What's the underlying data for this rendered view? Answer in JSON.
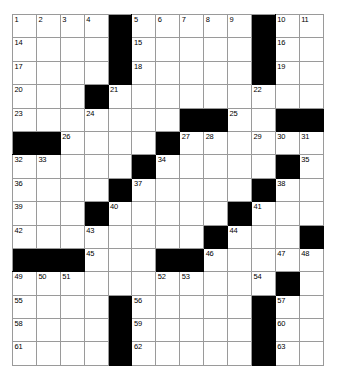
{
  "puzzle": {
    "type": "crossword-grid",
    "rows": 14,
    "cols": 13,
    "colors": {
      "block": "#000000",
      "cell": "#ffffff",
      "gridline": "#9a9a9a",
      "number": "#000000",
      "page_background": "#ffffff"
    },
    "cells": [
      [
        {
          "n": "1"
        },
        {
          "n": "2"
        },
        {
          "n": "3"
        },
        {
          "n": "4"
        },
        {
          "b": true
        },
        {
          "n": "5"
        },
        {
          "n": "6"
        },
        {
          "n": "7"
        },
        {
          "n": "8"
        },
        {
          "n": "9"
        },
        {
          "b": true
        },
        {
          "n": "10"
        },
        {
          "n": "11"
        },
        {
          "n": "12"
        },
        {
          "n": "13"
        }
      ],
      [
        {
          "n": "14"
        },
        {},
        {},
        {},
        {
          "b": true
        },
        {
          "n": "15"
        },
        {},
        {},
        {},
        {},
        {
          "b": true
        },
        {
          "n": "16"
        },
        {},
        {},
        {}
      ],
      [
        {
          "n": "17"
        },
        {},
        {},
        {},
        {
          "b": true
        },
        {
          "n": "18"
        },
        {},
        {},
        {},
        {},
        {
          "b": true
        },
        {
          "n": "19"
        },
        {},
        {},
        {}
      ],
      [
        {
          "n": "20"
        },
        {},
        {},
        {
          "b": true
        },
        {
          "n": "21"
        },
        {},
        {},
        {},
        {},
        {},
        {
          "n": "22"
        },
        {},
        {},
        {},
        {}
      ],
      [
        {
          "n": "23"
        },
        {},
        {},
        {
          "n": "24"
        },
        {},
        {},
        {},
        {
          "b": true
        },
        {
          "b": true
        },
        {
          "n": "25"
        },
        {},
        {},
        {
          "b": true
        },
        {
          "b": true
        },
        {
          "b": true
        }
      ],
      [
        {
          "b": true
        },
        {
          "b": true
        },
        {
          "n": "26"
        },
        {},
        {},
        {},
        {
          "b": true
        },
        {
          "n": "27"
        },
        {
          "n": "28"
        },
        {},
        {},
        {},
        {
          "n": "29"
        },
        {
          "n": "30"
        },
        {
          "n": "31"
        }
      ],
      [
        {
          "n": "32"
        },
        {
          "n": "33"
        },
        {},
        {},
        {},
        {
          "b": true
        },
        {
          "n": "34"
        },
        {},
        {},
        {},
        {},
        {
          "b": true
        },
        {
          "n": "35"
        },
        {},
        {}
      ],
      [
        {
          "n": "36"
        },
        {},
        {},
        {},
        {
          "b": true
        },
        {
          "n": "37"
        },
        {},
        {},
        {},
        {},
        {
          "b": true
        },
        {
          "n": "38"
        },
        {},
        {},
        {}
      ],
      [
        {
          "n": "39"
        },
        {},
        {},
        {
          "b": true
        },
        {
          "n": "40"
        },
        {},
        {},
        {},
        {},
        {
          "b": true
        },
        {
          "n": "41"
        },
        {},
        {},
        {},
        {}
      ],
      [
        {
          "n": "42"
        },
        {},
        {},
        {
          "n": "43"
        },
        {},
        {},
        {},
        {},
        {
          "b": true
        },
        {
          "n": "44"
        },
        {},
        {},
        {},
        {
          "b": true
        },
        {
          "b": true
        }
      ],
      [
        {
          "b": true
        },
        {
          "b": true
        },
        {
          "b": true
        },
        {
          "n": "45"
        },
        {},
        {},
        {
          "b": true
        },
        {
          "b": true
        },
        {
          "n": "46"
        },
        {},
        {},
        {},
        {},
        {
          "n": "47"
        },
        {
          "n": "48"
        }
      ],
      [
        {
          "n": "49"
        },
        {
          "n": "50"
        },
        {
          "n": "51"
        },
        {},
        {},
        {},
        {
          "n": "52"
        },
        {
          "n": "53"
        },
        {},
        {},
        {},
        {
          "b": true
        },
        {
          "n": "54"
        },
        {},
        {}
      ],
      [
        {
          "n": "55"
        },
        {},
        {},
        {},
        {
          "b": true
        },
        {
          "n": "56"
        },
        {},
        {},
        {},
        {},
        {
          "b": true
        },
        {
          "n": "57"
        },
        {},
        {},
        {}
      ],
      [
        {
          "n": "58"
        },
        {},
        {},
        {},
        {
          "b": true
        },
        {
          "n": "59"
        },
        {},
        {},
        {},
        {},
        {
          "b": true
        },
        {
          "n": "60"
        },
        {},
        {},
        {}
      ],
      [
        {
          "n": "61"
        },
        {},
        {},
        {},
        {
          "b": true
        },
        {
          "n": "62"
        },
        {},
        {},
        {},
        {},
        {
          "b": true
        },
        {
          "n": "63"
        },
        {},
        {},
        {}
      ]
    ],
    "grid": [
      {
        "row": 1,
        "blocks": [
          4,
          10
        ],
        "numbers": {
          "0": "1",
          "1": "2",
          "2": "3",
          "3": "4",
          "5": "5",
          "6": "6",
          "7": "7",
          "8": "8",
          "9": "9",
          "11": "10",
          "12": "11",
          "13": "12",
          "14": "13"
        }
      },
      {
        "row": 2,
        "blocks": [
          4,
          10
        ],
        "numbers": {
          "0": "14",
          "5": "15",
          "11": "16"
        }
      },
      {
        "row": 3,
        "blocks": [
          4,
          10
        ],
        "numbers": {
          "0": "17",
          "5": "18",
          "11": "19"
        }
      },
      {
        "row": 4,
        "blocks": [
          3
        ],
        "numbers": {
          "0": "20",
          "4": "21",
          "10": "22"
        }
      },
      {
        "row": 5,
        "blocks": [
          7,
          8,
          11,
          12
        ],
        "numbers": {
          "0": "23",
          "3": "24",
          "9": "25"
        }
      },
      {
        "row": 6,
        "blocks": [
          0,
          1,
          6
        ],
        "numbers": {
          "2": "26",
          "7": "27",
          "8": "28",
          "10": "29",
          "11": "30",
          "12": "31"
        }
      },
      {
        "row": 7,
        "blocks": [
          5,
          11
        ],
        "numbers": {
          "0": "32",
          "1": "33",
          "6": "34",
          "12": "35"
        }
      },
      {
        "row": 8,
        "blocks": [
          4,
          10
        ],
        "numbers": {
          "0": "36",
          "5": "37",
          "11": "38"
        }
      },
      {
        "row": 9,
        "blocks": [
          3,
          9
        ],
        "numbers": {
          "0": "39",
          "4": "40",
          "10": "41"
        }
      },
      {
        "row": 10,
        "blocks": [
          8,
          12
        ],
        "numbers": {
          "0": "42",
          "3": "43",
          "9": "44"
        }
      },
      {
        "row": 11,
        "blocks": [
          0,
          1,
          2,
          6,
          7
        ],
        "numbers": {
          "3": "45",
          "8": "46",
          "11": "47",
          "12": "48"
        }
      },
      {
        "row": 12,
        "blocks": [
          11
        ],
        "numbers": {
          "0": "49",
          "1": "50",
          "2": "51",
          "6": "52",
          "7": "53",
          "10": "54"
        }
      },
      {
        "row": 13,
        "blocks": [
          4,
          10
        ],
        "numbers": {
          "0": "55",
          "5": "56",
          "11": "57"
        }
      },
      {
        "row": 14,
        "blocks": [
          4,
          10
        ],
        "numbers": {
          "0": "58",
          "5": "59",
          "11": "60"
        }
      },
      {
        "row": 15,
        "blocks": [
          4,
          10
        ],
        "numbers": {
          "0": "61",
          "5": "62",
          "11": "63"
        }
      }
    ],
    "clue_numbers": [
      "1",
      "2",
      "3",
      "4",
      "5",
      "6",
      "7",
      "8",
      "9",
      "10",
      "11",
      "12",
      "13",
      "14",
      "15",
      "16",
      "17",
      "18",
      "19",
      "20",
      "21",
      "22",
      "23",
      "24",
      "25",
      "26",
      "27",
      "28",
      "29",
      "30",
      "31",
      "32",
      "33",
      "34",
      "35",
      "36",
      "37",
      "38",
      "39",
      "40",
      "41",
      "42",
      "43",
      "44",
      "45",
      "46",
      "47",
      "48",
      "49",
      "50",
      "51",
      "52",
      "53",
      "54",
      "55",
      "56",
      "57",
      "58",
      "59",
      "60",
      "61",
      "62",
      "63"
    ]
  }
}
